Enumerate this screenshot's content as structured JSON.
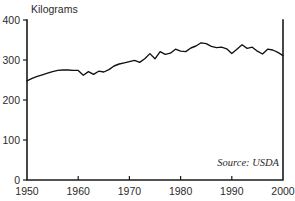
{
  "chart_data": {
    "type": "line",
    "title": "",
    "subtitle": "",
    "unit_label": "Kilograms",
    "xlabel": "",
    "ylabel": "Kilograms",
    "source_note": "Source: USDA",
    "grid": false,
    "legend": "none",
    "xlim": [
      1950,
      2000
    ],
    "ylim": [
      0,
      400
    ],
    "xticks": [
      1950,
      1960,
      1970,
      1980,
      1990,
      2000
    ],
    "xtick_labels": [
      "1950",
      "1960",
      "1970",
      "1980",
      "1990",
      "2000"
    ],
    "yticks": [
      0,
      100,
      200,
      300,
      400
    ],
    "ytick_labels": [
      "0",
      "100",
      "200",
      "300",
      "400"
    ],
    "line_color": "#111111",
    "axis_color": "#1a1a1a",
    "series": [
      {
        "name": "Per capita consumption",
        "x": [
          1950,
          1951,
          1952,
          1953,
          1954,
          1955,
          1956,
          1957,
          1958,
          1959,
          1960,
          1961,
          1962,
          1963,
          1964,
          1965,
          1966,
          1967,
          1968,
          1969,
          1970,
          1971,
          1972,
          1973,
          1974,
          1975,
          1976,
          1977,
          1978,
          1979,
          1980,
          1981,
          1982,
          1983,
          1984,
          1985,
          1986,
          1987,
          1988,
          1989,
          1990,
          1991,
          1992,
          1993,
          1994,
          1995,
          1996,
          1997,
          1998,
          1999,
          2000
        ],
        "values": [
          248,
          254,
          259,
          263,
          267,
          271,
          274,
          275,
          275,
          274,
          274,
          262,
          271,
          264,
          272,
          270,
          276,
          285,
          290,
          293,
          296,
          299,
          294,
          303,
          316,
          303,
          321,
          314,
          317,
          327,
          322,
          321,
          330,
          335,
          343,
          341,
          334,
          331,
          332,
          328,
          316,
          327,
          338,
          329,
          332,
          322,
          315,
          327,
          325,
          319,
          311
        ]
      }
    ]
  }
}
